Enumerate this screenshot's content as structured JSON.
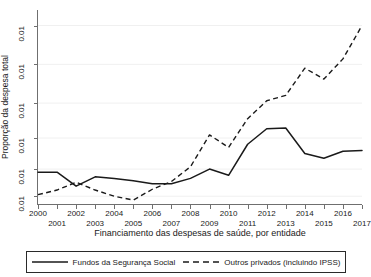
{
  "chart_data": {
    "type": "line",
    "title": "",
    "xlabel": "Financiamento das despesas de saúde, por entidade",
    "ylabel": "Proporção da despesa total",
    "grid": true,
    "legend_position": "bottom",
    "x": [
      2000,
      2001,
      2002,
      2003,
      2004,
      2005,
      2006,
      2007,
      2008,
      2009,
      2010,
      2011,
      2012,
      2013,
      2014,
      2015,
      2016,
      2017
    ],
    "xlim": [
      2000,
      2017
    ],
    "ylim": [
      0.0075,
      0.0325
    ],
    "xtick_labels_top": [
      "2000",
      "2002",
      "2004",
      "2006",
      "2008",
      "2010",
      "2012",
      "2014",
      "2016"
    ],
    "xtick_labels_bottom": [
      "2001",
      "2003",
      "2005",
      "2007",
      "2009",
      "2011",
      "2013",
      "2015",
      "2017"
    ],
    "ytick_labels": [
      "0.01",
      "0.01",
      "0.01",
      "0.01",
      "0.01",
      "0.01"
    ],
    "ytick_values": [
      0.0305,
      0.0255,
      0.0205,
      0.016,
      0.012,
      0.0085
    ],
    "series": [
      {
        "name": "Fundos da Segurança Social",
        "style": "solid",
        "color": "#1a1a1a",
        "values": [
          0.0116,
          0.0116,
          0.0098,
          0.011,
          0.0108,
          0.0105,
          0.0101,
          0.0101,
          0.0108,
          0.012,
          0.0112,
          0.0152,
          0.0172,
          0.0173,
          0.014,
          0.0134,
          0.0143,
          0.0144
        ]
      },
      {
        "name": "Outros privados (incluindo IPSS)",
        "style": "dashed",
        "color": "#1a1a1a",
        "values": [
          0.0087,
          0.0093,
          0.0103,
          0.0093,
          0.0085,
          0.008,
          0.0094,
          0.0104,
          0.0123,
          0.0164,
          0.0148,
          0.0185,
          0.0208,
          0.0215,
          0.025,
          0.0236,
          0.0262,
          0.0305
        ]
      }
    ]
  },
  "axes": {
    "ylabel": "Proporção da despesa total",
    "xlabel": "Financiamento das despesas de saúde, por entidade"
  },
  "legend": {
    "entries": [
      {
        "label": "Fundos da Segurança Social",
        "style": "solid"
      },
      {
        "label": "Outros privados (incluindo IPSS)",
        "style": "dashed"
      }
    ]
  }
}
